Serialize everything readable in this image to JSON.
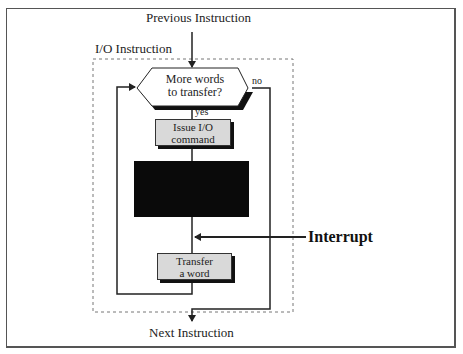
{
  "diagram": {
    "title_top": "Previous Instruction",
    "group_label": "I/O Instruction",
    "decision": {
      "line1": "More words",
      "line2": "to transfer?"
    },
    "branch_yes": "yes",
    "branch_no": "no",
    "step_issue": {
      "line1": "Issue I/O",
      "line2": "command"
    },
    "step_transfer": {
      "line1": "Transfer",
      "line2": "a word"
    },
    "interrupt_label": "Interrupt",
    "title_bottom": "Next Instruction",
    "colors": {
      "box_fill": "#d9d9d9",
      "shadow": "#111111",
      "redacted_block": "#0a0a0a",
      "line": "#222222"
    }
  }
}
